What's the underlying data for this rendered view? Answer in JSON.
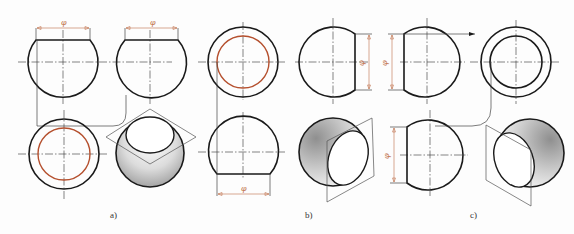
{
  "figure": {
    "panels": [
      {
        "id": "a",
        "caption": "a)",
        "dimension_symbol": "φ"
      },
      {
        "id": "b",
        "caption": "b)",
        "dimension_symbol": "φ"
      },
      {
        "id": "c",
        "caption": "c)",
        "dimension_symbol": "φ"
      }
    ],
    "colors": {
      "outline": "#1a1a1a",
      "hole_circle": "#b5502e",
      "dimension": "#c0704a",
      "shading_dark": "#9a9a9a",
      "shading_light": "#ffffff"
    }
  }
}
